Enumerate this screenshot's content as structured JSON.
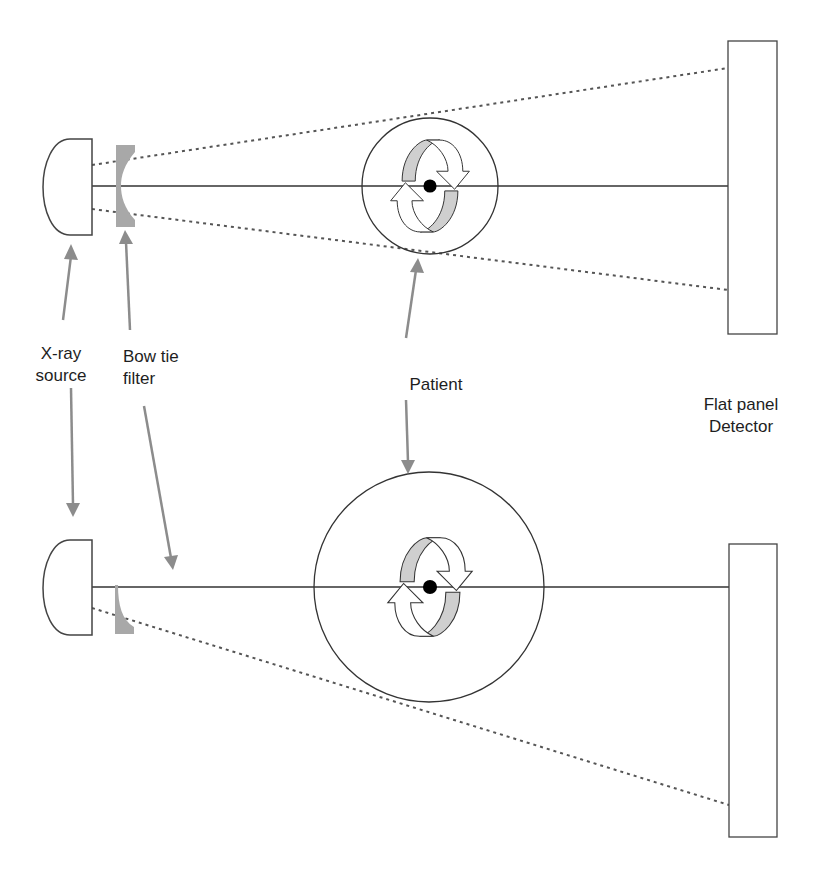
{
  "colors": {
    "line": "#333333",
    "arrow": "#8c8c8c",
    "filter": "#a8a8a8",
    "rotation_fill": "#cfcfcf",
    "background": "#ffffff"
  },
  "labels": {
    "xray_source": [
      "X-ray",
      "source"
    ],
    "bow_tie_filter": [
      "Bow tie",
      "filter"
    ],
    "patient": "Patient",
    "detector": [
      "Flat panel",
      "Detector"
    ]
  },
  "configurations": [
    {
      "name": "top",
      "description": "Small patient, full fan beam with symmetric bow tie filter",
      "source": {
        "x": 43,
        "y": 139,
        "w": 49,
        "h": 96
      },
      "axis_y": 186,
      "patient_circle": {
        "cx": 430,
        "cy": 186,
        "r": 68
      },
      "detector": {
        "x": 728,
        "y": 41,
        "w": 49,
        "h": 293
      },
      "beam_edges": [
        [
          92,
          165,
          728,
          68
        ],
        [
          92,
          209,
          728,
          290
        ]
      ]
    },
    {
      "name": "bottom",
      "description": "Large patient, half fan beam (offset detector) with half bow tie filter",
      "source": {
        "x": 43,
        "y": 540,
        "w": 49,
        "h": 95
      },
      "axis_y": 587,
      "patient_circle": {
        "cx": 429,
        "cy": 587,
        "r": 115
      },
      "detector": {
        "x": 729,
        "y": 544,
        "w": 48,
        "h": 293
      },
      "beam_edges": [
        [
          92,
          608,
          729,
          805
        ]
      ]
    }
  ]
}
